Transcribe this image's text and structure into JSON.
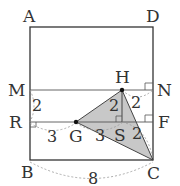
{
  "diagram": {
    "type": "geometry",
    "points": {
      "A": {
        "label": "A",
        "x": 30,
        "y": 27
      },
      "D": {
        "label": "D",
        "x": 153,
        "y": 27
      },
      "M": {
        "label": "M",
        "x": 30,
        "y": 90
      },
      "N": {
        "label": "N",
        "x": 153,
        "y": 90
      },
      "R": {
        "label": "R",
        "x": 30,
        "y": 122
      },
      "F": {
        "label": "F",
        "x": 153,
        "y": 122
      },
      "B": {
        "label": "B",
        "x": 30,
        "y": 160
      },
      "C": {
        "label": "C",
        "x": 153,
        "y": 160
      },
      "H": {
        "label": "H",
        "x": 122,
        "y": 90
      },
      "G": {
        "label": "G",
        "x": 76,
        "y": 122
      },
      "S": {
        "label": "S",
        "x": 122,
        "y": 122
      }
    },
    "measurements": {
      "MR": "2",
      "RG": "3",
      "GS": "3",
      "HS": "2",
      "HN": "2",
      "SC": "2",
      "BC": "8"
    },
    "shaded_triangle": [
      "H",
      "G",
      "C"
    ],
    "colors": {
      "stroke": "#333333",
      "shade": "#c8c8c8",
      "dashed": "#999999"
    }
  }
}
